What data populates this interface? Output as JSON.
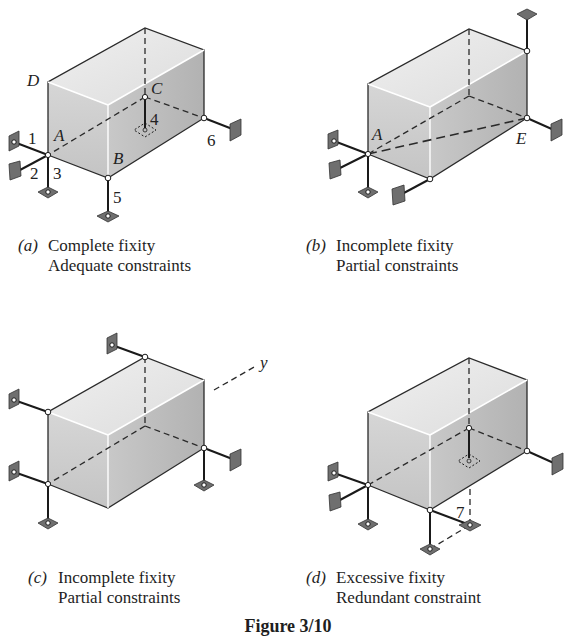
{
  "figure": {
    "title": "Figure 3/10",
    "colors": {
      "top_face": "#e9e9e9",
      "front_face": "#cfcfcf",
      "side_face": "#bdbdbd",
      "edge": "#2a2a2a",
      "support_plate": "#6f6f6f"
    },
    "panels": [
      {
        "id": "a",
        "tag": "(a)",
        "line1": "Complete fixity",
        "line2": "Adequate constraints",
        "point_labels": [
          "D",
          "A",
          "B",
          "C"
        ],
        "link_labels": [
          "1",
          "2",
          "3",
          "4",
          "5",
          "6"
        ]
      },
      {
        "id": "b",
        "tag": "(b)",
        "line1": "Incomplete fixity",
        "line2": "Partial constraints",
        "point_labels": [
          "A",
          "E"
        ]
      },
      {
        "id": "c",
        "tag": "(c)",
        "line1": "Incomplete fixity",
        "line2": "Partial constraints",
        "axis_label": "y"
      },
      {
        "id": "d",
        "tag": "(d)",
        "line1": "Excessive fixity",
        "line2": "Redundant constraint",
        "link_labels": [
          "7"
        ]
      }
    ]
  }
}
